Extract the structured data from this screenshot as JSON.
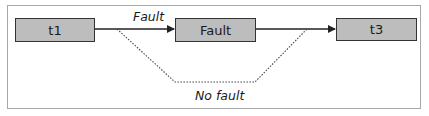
{
  "diagram": {
    "nodes": [
      {
        "id": "t1",
        "label": "t1"
      },
      {
        "id": "fault",
        "label": "Fault"
      },
      {
        "id": "t3",
        "label": "t3"
      }
    ],
    "edges": [
      {
        "from": "t1",
        "to": "fault",
        "label": "Fault",
        "style": "solid"
      },
      {
        "from": "fault",
        "to": "t3",
        "label": "",
        "style": "solid"
      },
      {
        "from": "t1",
        "to": "t3",
        "label": "No fault",
        "style": "dotted"
      }
    ],
    "colors": {
      "node_fill": "#bdbdbd",
      "node_border": "#333333",
      "edge": "#222222",
      "frame": "#a8a8a8"
    }
  }
}
